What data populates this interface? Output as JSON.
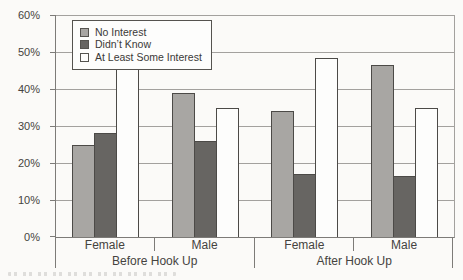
{
  "colors": {
    "paper": "#fbfaf8",
    "bar_no_interest": "#a8a6a3",
    "bar_didnt_know": "#676562",
    "bar_at_least_some_interest": "#fdfdfc",
    "bar_outline": "#4c4a47",
    "gridline": "#a3a19e",
    "axis": "#7d7b78",
    "text": "#454340"
  },
  "chart_data": {
    "type": "bar",
    "title": "",
    "xlabel": "",
    "ylabel": "",
    "ylim": [
      0,
      60
    ],
    "ytick_step": 10,
    "ytick_labels": [
      "0%",
      "10%",
      "20%",
      "30%",
      "40%",
      "50%",
      "60%"
    ],
    "grid": true,
    "legend_position": "top-left inside plot area",
    "group_labels": [
      "Before Hook Up",
      "After Hook Up"
    ],
    "categories": [
      "Female",
      "Male",
      "Female",
      "Male"
    ],
    "series": [
      {
        "name": "No Interest",
        "color": "#a8a6a3",
        "values": [
          25,
          39,
          34,
          46.5
        ]
      },
      {
        "name": "Didn’t Know",
        "color": "#676562",
        "values": [
          28,
          26,
          17,
          16.5
        ]
      },
      {
        "name": "At Least Some Interest",
        "color": "#fdfdfc",
        "values": [
          47,
          35,
          48.5,
          35
        ]
      }
    ]
  }
}
